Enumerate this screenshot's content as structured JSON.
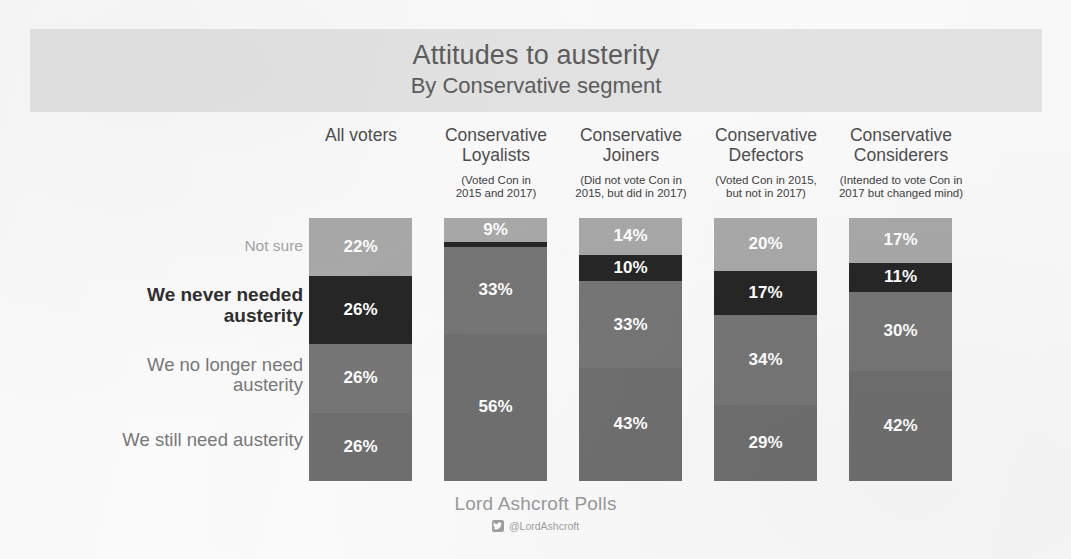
{
  "header": {
    "title": "Attitudes to austerity",
    "subtitle": "By Conservative segment",
    "band_color": "#e4e4e4"
  },
  "footer": {
    "brand": "Lord Ashcroft Polls",
    "handle": "@LordAshcroft",
    "twitter_icon": "twitter-bird-icon"
  },
  "row_labels": {
    "not_sure": "Not sure",
    "never_needed": "We never needed\nausterity",
    "no_longer_need": "We no longer need\nausterity",
    "still_need": "We still need austerity"
  },
  "columns": [
    {
      "name": "All voters",
      "note": ""
    },
    {
      "name": "Conservative\nLoyalists",
      "note": "(Voted Con in\n2015 and 2017)"
    },
    {
      "name": "Conservative\nJoiners",
      "note": "(Did not vote Con in\n2015, but did in 2017)"
    },
    {
      "name": "Conservative\nDefectors",
      "note": "(Voted Con in 2015,\nbut not in 2017)"
    },
    {
      "name": "Conservative\nConsiderers",
      "note": "(Intended to vote Con in\n2017 but changed mind)"
    }
  ],
  "chart_data": {
    "type": "bar",
    "subtype": "stacked-column-100",
    "title": "Attitudes to austerity",
    "subtitle": "By Conservative segment",
    "xlabel": "",
    "ylabel": "",
    "ylim": [
      0,
      100
    ],
    "grid": false,
    "legend_position": "left-row-labels",
    "value_suffix": "%",
    "categories": [
      "All voters",
      "Conservative Loyalists",
      "Conservative Joiners",
      "Conservative Defectors",
      "Conservative Considerers"
    ],
    "series": [
      {
        "name": "Not sure",
        "color": "#a9a9a9",
        "values": [
          22,
          9,
          14,
          20,
          17
        ],
        "labels": [
          "22%",
          "9%",
          "14%",
          "20%",
          "17%"
        ]
      },
      {
        "name": "We never needed austerity",
        "color": "#262626",
        "values": [
          26,
          2,
          10,
          17,
          11
        ],
        "labels": [
          "26%",
          "",
          "10%",
          "17%",
          "11%"
        ]
      },
      {
        "name": "We no longer need austerity",
        "color": "#767676",
        "values": [
          26,
          33,
          33,
          34,
          30
        ],
        "labels": [
          "26%",
          "33%",
          "33%",
          "34%",
          "30%"
        ]
      },
      {
        "name": "We still need austerity",
        "color": "#6f6f6f",
        "values": [
          26,
          56,
          43,
          29,
          42
        ],
        "labels": [
          "26%",
          "56%",
          "43%",
          "29%",
          "42%"
        ]
      }
    ]
  }
}
